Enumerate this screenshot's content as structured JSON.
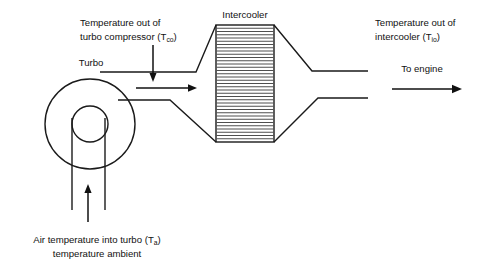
{
  "diagram": {
    "canvas": {
      "width": 483,
      "height": 265,
      "background": "#ffffff"
    },
    "colors": {
      "line": "#1a1a1a",
      "fin": "#3a3a3a",
      "arrow": "#111111",
      "text": "#111111",
      "background": "#ffffff"
    },
    "labels": {
      "turbo": "Turbo",
      "intercooler": "Intercooler",
      "to_engine": "To engine",
      "temp_out_compressor_line1": "Temperature out of",
      "temp_out_compressor_line2": "turbo compressor (T",
      "temp_out_compressor_sub": "co",
      "temp_out_compressor_close": ")",
      "temp_out_intercooler_line1": "Temperature out of",
      "temp_out_intercooler_line2": "intercooler (T",
      "temp_out_intercooler_sub": "io",
      "temp_out_intercooler_close": ")",
      "air_temp_line1_pre": "Air temperature into turbo (T",
      "air_temp_line1_sub": "a",
      "air_temp_line1_close": ")",
      "air_temp_line2": "temperature ambient"
    },
    "components": {
      "turbo_outer_circle": {
        "cx": 90,
        "cy": 124,
        "r": 45
      },
      "turbo_inner_circle": {
        "cx": 90,
        "cy": 124,
        "r": 18
      },
      "intake_duct_left_x": 72,
      "intake_duct_right_x": 105,
      "intake_duct_bottom_y": 210,
      "intercooler_box": {
        "x": 216,
        "y": 25,
        "width": 58,
        "height": 117
      },
      "intercooler_fin_count": 35
    },
    "arrows": {
      "compressor_down": {
        "x": 153,
        "y1": 45,
        "y2": 80
      },
      "flow_right": {
        "x1": 136,
        "x2": 196,
        "y": 88
      },
      "intake_up": {
        "x": 88,
        "y1": 222,
        "y2": 185
      },
      "to_engine": {
        "x1": 392,
        "x2": 462,
        "y": 89
      }
    }
  }
}
